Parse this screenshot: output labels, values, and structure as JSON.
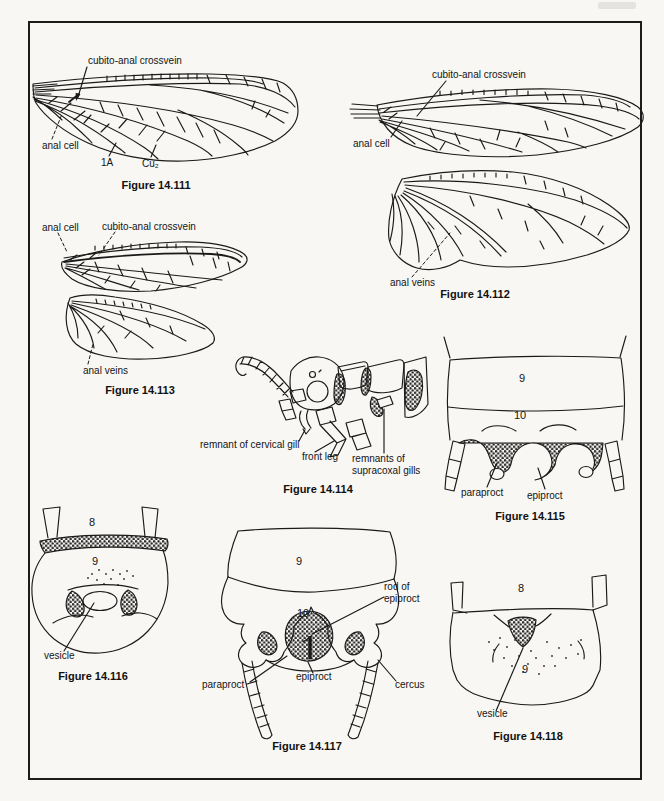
{
  "page": {
    "ink": "#1a1a1a",
    "paper": "#f8f7f4"
  },
  "fig111": {
    "caption": "Figure 14.111",
    "crossvein": "cubito-anal crossvein",
    "anal_cell": "anal cell",
    "vein_1a": "1A",
    "vein_cu2": "Cu₂"
  },
  "fig112": {
    "caption": "Figure 14.112",
    "crossvein": "cubito-anal crossvein",
    "anal_cell": "anal cell",
    "anal_veins": "anal veins"
  },
  "fig113": {
    "caption": "Figure 14.113",
    "crossvein": "cubito-anal crossvein",
    "anal_cell": "anal cell",
    "anal_veins": "anal veins"
  },
  "fig114": {
    "caption": "Figure 14.114",
    "cervical": "remnant of cervical gill",
    "front_leg": "front leg",
    "supracoxal": "remnants of supracoxal gills"
  },
  "fig115": {
    "caption": "Figure 14.115",
    "seg9": "9",
    "seg10": "10",
    "paraproct": "paraproct",
    "epiproct": "epiproct"
  },
  "fig116": {
    "caption": "Figure 14.116",
    "seg8": "8",
    "seg9": "9",
    "vesicle": "vesicle"
  },
  "fig117": {
    "caption": "Figure 14.117",
    "seg9": "9",
    "seg10": "10",
    "rod": "rod of epiproct",
    "paraproct": "paraproct",
    "epiproct": "epiproct",
    "cercus": "cercus"
  },
  "fig118": {
    "caption": "Figure 14.118",
    "seg8": "8",
    "seg9": "9",
    "vesicle": "vesicle"
  }
}
